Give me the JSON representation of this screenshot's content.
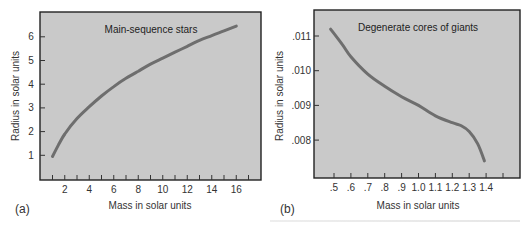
{
  "chart_data": [
    {
      "type": "line",
      "panel_label": "(a)",
      "title": "Main-sequence stars",
      "xlabel": "Mass in solar units",
      "ylabel": "Radius in solar units",
      "x_ticks": [
        2,
        4,
        6,
        8,
        10,
        12,
        14,
        16
      ],
      "x_minor_ticks": [
        1,
        2,
        3,
        4,
        5,
        6,
        7,
        8,
        9,
        10,
        11,
        12,
        13,
        14,
        15,
        16,
        17
      ],
      "y_ticks": [
        1,
        2,
        3,
        4,
        5,
        6
      ],
      "xlim": [
        0,
        18
      ],
      "ylim": [
        0,
        7
      ],
      "grid": false,
      "series": [
        {
          "name": "Main-sequence stars",
          "x": [
            1,
            1.5,
            2,
            3,
            4,
            5,
            6,
            7,
            8,
            9,
            10,
            11,
            12,
            13,
            14,
            15,
            16
          ],
          "y": [
            0.95,
            1.45,
            1.9,
            2.55,
            3.05,
            3.5,
            3.9,
            4.25,
            4.55,
            4.85,
            5.1,
            5.35,
            5.6,
            5.85,
            6.05,
            6.25,
            6.45
          ]
        }
      ]
    },
    {
      "type": "line",
      "panel_label": "(b)",
      "title": "Degenerate cores of giants",
      "xlabel": "Mass in solar units",
      "ylabel": "Radius in solar units",
      "x_ticks": [
        ".5",
        ".6",
        ".7",
        ".8",
        ".9",
        "1.0",
        "1.1",
        "1.2",
        "1.3",
        "1.4"
      ],
      "x_tick_values": [
        0.5,
        0.6,
        0.7,
        0.8,
        0.9,
        1.0,
        1.1,
        1.2,
        1.3,
        1.4,
        1.5
      ],
      "y_ticks": [
        ".011",
        ".010",
        ".009",
        ".008"
      ],
      "y_tick_values": [
        0.011,
        0.01,
        0.009,
        0.008
      ],
      "xlim": [
        0.4,
        1.6
      ],
      "ylim": [
        0.0071,
        0.0116
      ],
      "grid": false,
      "series": [
        {
          "name": "Degenerate cores of giants",
          "x": [
            0.48,
            0.55,
            0.6,
            0.7,
            0.8,
            0.9,
            1.0,
            1.1,
            1.2,
            1.25,
            1.3,
            1.35,
            1.39
          ],
          "y": [
            0.0112,
            0.01075,
            0.0104,
            0.0099,
            0.00955,
            0.00925,
            0.009,
            0.0087,
            0.0085,
            0.00842,
            0.00825,
            0.0079,
            0.0074
          ]
        }
      ]
    }
  ],
  "figure": {
    "a": {
      "title": "Main-sequence stars",
      "panel": "(a)",
      "xlabel": "Mass in solar units",
      "ylabel": "Radius in solar units"
    },
    "b": {
      "title": "Degenerate cores of giants",
      "panel": "(b)",
      "xlabel": "Mass in solar units",
      "ylabel": "Radius in solar units"
    }
  },
  "colors": {
    "plot_background": "#c9c9c9",
    "curve": "#6e6e6e",
    "axes": "#222222"
  }
}
